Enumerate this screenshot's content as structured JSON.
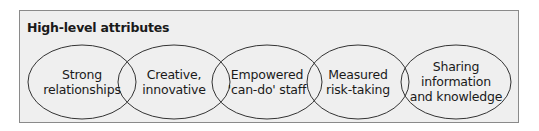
{
  "panel": {
    "title": "High-level attributes",
    "fill_color": "#efefef",
    "border_color": "#8a8a8a"
  },
  "attributes": [
    {
      "line1": "Strong",
      "line2": "relationships",
      "line3": ""
    },
    {
      "line1": "Creative,",
      "line2": "innovative",
      "line3": ""
    },
    {
      "line1": "Empowered",
      "line2": "'can-do' staff",
      "line3": ""
    },
    {
      "line1": "Measured",
      "line2": "risk-taking",
      "line3": ""
    },
    {
      "line1": "Sharing",
      "line2": "information",
      "line3": "and knowledge"
    }
  ]
}
